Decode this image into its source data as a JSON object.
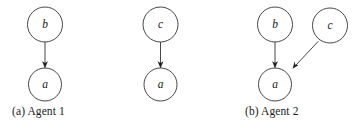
{
  "figure": {
    "background_color": "#ffffff",
    "ink_color": "#262626",
    "panels": [
      {
        "id": "a",
        "caption": "(a) Agent 1",
        "nodes": [
          {
            "id": "b",
            "label": "b",
            "cx": 45,
            "cy": 24.5,
            "r": 17.5
          },
          {
            "id": "a",
            "label": "a",
            "cx": 45,
            "cy": 84.5,
            "r": 16.5
          }
        ],
        "edges": [
          {
            "from": "b",
            "to": "a",
            "x1": 45,
            "y1": 42,
            "x2": 45,
            "y2": 68
          }
        ]
      },
      {
        "id": "b",
        "caption": "(b) Agent 2",
        "nodes": [
          {
            "id": "c",
            "label": "c",
            "cx": 160.5,
            "cy": 24.5,
            "r": 17.5
          },
          {
            "id": "a",
            "label": "a",
            "cx": 160.5,
            "cy": 84.5,
            "r": 16.5
          }
        ],
        "edges": [
          {
            "from": "c",
            "to": "a",
            "x1": 160.5,
            "y1": 42,
            "x2": 160.5,
            "y2": 68
          }
        ]
      },
      {
        "id": "c",
        "caption": "(c) Updated\ngraph",
        "nodes": [
          {
            "id": "b",
            "label": "b",
            "cx": 275,
            "cy": 24.5,
            "r": 17.5
          },
          {
            "id": "c",
            "label": "c",
            "cx": 330,
            "cy": 25.5,
            "r": 17.5
          },
          {
            "id": "a",
            "label": "a",
            "cx": 275,
            "cy": 84.5,
            "r": 16.5
          }
        ],
        "edges": [
          {
            "from": "b",
            "to": "a",
            "x1": 275,
            "y1": 42,
            "x2": 275,
            "y2": 68
          },
          {
            "from": "c",
            "to": "a",
            "x1": 318,
            "y1": 42,
            "x2": 292.5,
            "y2": 69
          }
        ]
      }
    ]
  }
}
